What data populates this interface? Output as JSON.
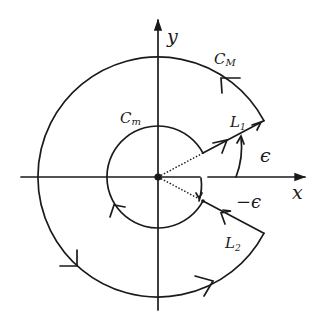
{
  "figure": {
    "axes": {
      "x_label": "x",
      "y_label": "y"
    },
    "contours": {
      "outer_arc": {
        "label": "C",
        "subscript": "M"
      },
      "inner_arc": {
        "label": "C",
        "subscript": "m"
      },
      "ray_upper": {
        "label": "L",
        "subscript": "1"
      },
      "ray_lower": {
        "label": "L",
        "subscript": "2"
      }
    },
    "angles": {
      "upper": "ϵ",
      "lower": "−ϵ"
    },
    "colors": {
      "ink": "#1a1a1a",
      "background": "#ffffff"
    }
  }
}
